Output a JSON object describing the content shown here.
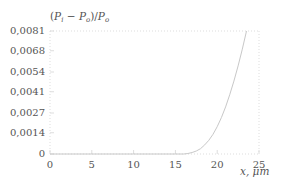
{
  "chart_data": {
    "type": "line",
    "title": "",
    "ylabel": "(P_i − P_o)/P_o",
    "ylabel_display": "(P",
    "xlabel": "x, μm",
    "xlim": [
      0,
      25
    ],
    "ylim": [
      0,
      0.0081
    ],
    "grid": false,
    "legend": null,
    "x_ticks": [
      0,
      5,
      10,
      15,
      20,
      25
    ],
    "x_tick_labels": [
      "0",
      "5",
      "10",
      "15",
      "20",
      "25"
    ],
    "y_ticks": [
      0,
      0.0014,
      0.0027,
      0.0041,
      0.0054,
      0.0068,
      0.0081
    ],
    "y_tick_labels": [
      "0",
      "0,0014",
      "0,0027",
      "0,0041",
      "0,0054",
      "0,0068",
      "0,0081"
    ],
    "series": [
      {
        "name": "(P_i − P_o)/P_o",
        "color": "#c8c8c8",
        "x": [
          0,
          5,
          10,
          15,
          16,
          16.5,
          17,
          17.5,
          18,
          18.5,
          19,
          19.5,
          20,
          20.5,
          21,
          21.5,
          22,
          22.5,
          23,
          23.5
        ],
        "y": [
          0,
          0,
          0,
          0,
          0,
          3e-05,
          0.0001,
          0.0002,
          0.00035,
          0.0006,
          0.0009,
          0.0013,
          0.0018,
          0.0024,
          0.0031,
          0.0039,
          0.0048,
          0.0058,
          0.0069,
          0.0081
        ]
      }
    ]
  },
  "axes": {
    "y_title_parts": {
      "open": "(",
      "pi": "P",
      "i_sub": "i",
      "minus": " − ",
      "po": "P",
      "o_sub": "o",
      "close": ")/",
      "po2": "P",
      "o_sub2": "o"
    },
    "x_title": "x, μm"
  }
}
